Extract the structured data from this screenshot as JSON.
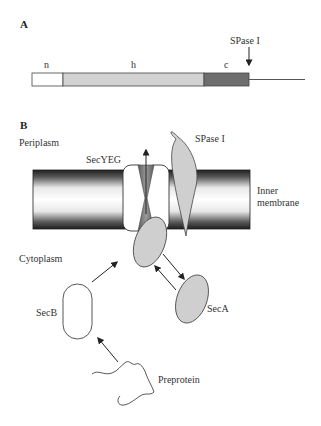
{
  "panel_a": {
    "label": "A",
    "regions": [
      {
        "name": "n",
        "label": "n",
        "color": "#ffffff"
      },
      {
        "name": "h",
        "label": "h",
        "color": "#d2d2d2"
      },
      {
        "name": "c",
        "label": "c",
        "color": "#6e6e6e"
      }
    ],
    "cleavage_label": "SPase I"
  },
  "panel_b": {
    "label": "B",
    "compartments": {
      "periplasm": "Periplasm",
      "cytoplasm": "Cytoplasm",
      "membrane_line1": "Inner",
      "membrane_line2": "membrane"
    },
    "components": {
      "secyeg": "SecYEG",
      "spase": "SPase I",
      "secb": "SecB",
      "seca": "SecA",
      "preprotein": "Preprotein"
    },
    "colors": {
      "protein_fill": "#cfcfcf",
      "membrane_dark": "#2a2a2a",
      "channel": "#7a7a7a"
    }
  }
}
